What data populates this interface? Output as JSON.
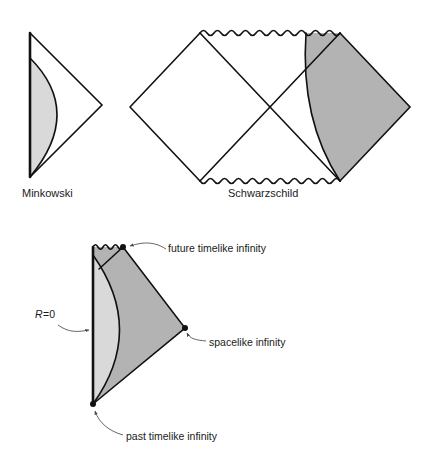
{
  "figure": {
    "title_visible": false,
    "background_color": "#ffffff",
    "line_color": "#111111",
    "shade_light": "#d9d9d9",
    "shade_dark": "#b3b3b3",
    "white_fill": "#ffffff"
  },
  "panels": {
    "minkowski": {
      "caption": "Minkowski",
      "caption_x": 22,
      "caption_y": 197,
      "description": "Conformal (Penrose) diagram of Minkowski spacetime: triangle with vertical R=0 axis on the left and a light-shaded lens region bounded by an outward-bulging curve.",
      "geometry": {
        "apex_top": [
          30,
          33
        ],
        "apex_bottom": [
          30,
          177
        ],
        "apex_right": [
          102,
          105
        ],
        "axis_thick_line": [
          [
            30,
            33
          ],
          [
            30,
            177
          ]
        ],
        "curve_start": [
          30,
          58
        ],
        "curve_end": [
          30,
          177
        ],
        "curve_control": [
          84,
          112
        ]
      }
    },
    "schwarzschild": {
      "caption": "Schwarzschild",
      "caption_x": 228,
      "caption_y": 197,
      "description": "Conformal diagram of the maximally extended Schwarzschild spacetime: two diamonds joined at the center, wavy singularity lines top and bottom, and a grey-shaded collapsing-star / interior region on the right.",
      "geometry": {
        "left_vertex": [
          130,
          107
        ],
        "right_vertex": [
          410,
          107
        ],
        "top_left_corner": [
          200,
          33
        ],
        "top_right_corner": [
          340,
          33
        ],
        "bottom_left_corner": [
          200,
          181
        ],
        "bottom_right_corner": [
          340,
          181
        ],
        "center": [
          270,
          107
        ],
        "wavy_top": [
          [
            200,
            33
          ],
          [
            340,
            33
          ]
        ],
        "wavy_bottom": [
          [
            200,
            181
          ],
          [
            340,
            181
          ]
        ],
        "shade_curve_start": [
          306,
          33
        ],
        "shade_curve_end": [
          340,
          181
        ],
        "shade_curve_control": [
          300,
          120
        ]
      }
    },
    "collapse": {
      "description": "Conformal diagram of gravitational collapse: vertical R=0 axis, wavy singularity at top, light-shaded stellar interior left of the curve, dark-shaded exterior, with labelled infinity points.",
      "geometry": {
        "axis_top": [
          93,
          247
        ],
        "axis_bottom": [
          93,
          404
        ],
        "singularity_right": [
          123,
          247
        ],
        "spacelike_vertex": [
          185,
          328
        ],
        "curve_start": [
          93,
          255
        ],
        "curve_end": [
          93,
          404
        ],
        "curve_control": [
          146,
          330
        ],
        "inner_wavy": [
          [
            93,
            247
          ],
          [
            123,
            247
          ]
        ]
      },
      "annotations": [
        {
          "name": "future-timelike-infinity",
          "label": "future timelike infinity",
          "text_x": 168,
          "text_y": 253,
          "dot": [
            123,
            247
          ],
          "leader": "M164,249 C150,240 138,243 128,246"
        },
        {
          "name": "spacelike-infinity",
          "label": "spacelike infinity",
          "text_x": 208,
          "text_y": 347,
          "dot": [
            185,
            328
          ],
          "leader": "M205,342 C196,340 190,338 187,332"
        },
        {
          "name": "past-timelike-infinity",
          "label": "past timelike infinity",
          "text_x": 125,
          "text_y": 440,
          "dot": [
            93,
            404
          ],
          "leader": "M122,435 C108,432 98,424 95,410"
        },
        {
          "name": "r-equals-zero",
          "label": "R=0",
          "text_x": 36,
          "text_y": 320,
          "leader": "M59,325 C70,332 78,332 88,330"
        }
      ]
    }
  },
  "labels": {
    "r_zero_italic": "R",
    "r_zero_rest": "=0"
  }
}
